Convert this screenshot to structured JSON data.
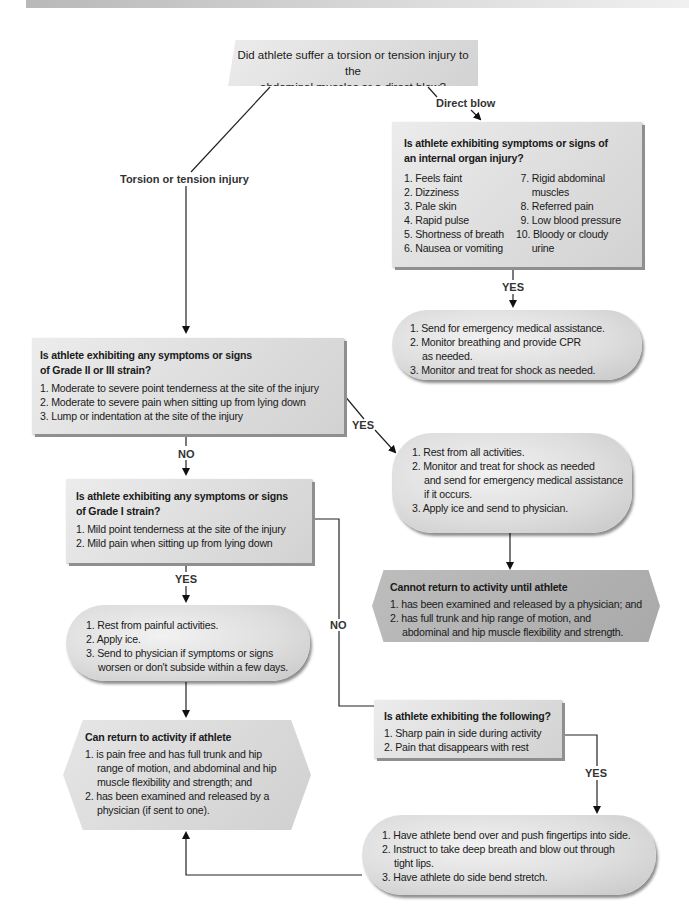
{
  "banner": {
    "color": "#c8c8c8"
  },
  "start": {
    "question_line1": "Did athlete suffer a torsion or tension injury to the",
    "question_line2": "abdominal muscles or a direct blow?"
  },
  "labels": {
    "direct_blow": "Direct blow",
    "torsion": "Torsion or tension injury",
    "yes_internal": "YES",
    "yes_grade23": "YES",
    "no_grade23": "NO",
    "yes_grade1": "YES",
    "no_grade1": "NO",
    "yes_side": "YES"
  },
  "internal_organ": {
    "title_line1": "Is athlete exhibiting symptoms or signs of",
    "title_line2": "an internal organ injury?",
    "left_items": [
      "1. Feels faint",
      "2. Dizziness",
      "3. Pale skin",
      "4. Rapid pulse",
      "5. Shortness of breath",
      "6. Nausea or vomiting"
    ],
    "right_items": [
      "7. Rigid abdominal",
      "muscles",
      "8. Referred pain",
      "9. Low blood pressure",
      "10. Bloody or cloudy",
      "urine"
    ]
  },
  "emergency_actions": {
    "items": [
      "1. Send for emergency medical assistance.",
      "2. Monitor breathing and provide CPR",
      "as needed.",
      "3. Monitor and treat for shock as needed."
    ]
  },
  "grade23": {
    "title_line1": "Is athlete exhibiting any symptoms or signs",
    "title_line2": "of Grade II or III strain?",
    "items": [
      "1. Moderate to severe point tenderness at the site of the injury",
      "2. Moderate to severe pain when sitting up from lying down",
      "3. Lump or indentation at the site of the injury"
    ]
  },
  "grade23_actions": {
    "items": [
      "1. Rest from all activities.",
      "2. Monitor and treat for shock as needed",
      "and send for emergency medical assistance",
      "if it occurs.",
      "3. Apply ice and send to physician."
    ]
  },
  "cannot_return": {
    "title": "Cannot return to activity until athlete",
    "items": [
      "1. has been examined and released by a physician; and",
      "2. has full trunk and hip range of motion, and",
      "abdominal and hip muscle flexibility and strength."
    ]
  },
  "grade1": {
    "title_line1": "Is athlete exhibiting any symptoms or signs",
    "title_line2": "of Grade I strain?",
    "items": [
      "1. Mild point tenderness at the site of the injury",
      "2. Mild pain when sitting up from lying down"
    ]
  },
  "grade1_actions": {
    "items": [
      "1. Rest from painful activities.",
      "2. Apply ice.",
      "3. Send to physician if symptoms or signs",
      "worsen or don't subside within a few days."
    ]
  },
  "can_return": {
    "title": "Can return to activity if athlete",
    "items": [
      "1. is pain free and has full trunk and hip",
      "range of motion, and abdominal and hip",
      "muscle flexibility and strength; and",
      "2. has been examined and released by a",
      "physician (if sent to one)."
    ]
  },
  "side_pain": {
    "title": "Is athlete exhibiting the following?",
    "items": [
      "1. Sharp pain in side during activity",
      "2. Pain that disappears with rest"
    ]
  },
  "side_actions": {
    "items": [
      "1. Have athlete bend over and push fingertips into side.",
      "2. Instruct to take deep breath and blow out through",
      "tight lips.",
      "3. Have athlete do side bend stretch."
    ]
  }
}
